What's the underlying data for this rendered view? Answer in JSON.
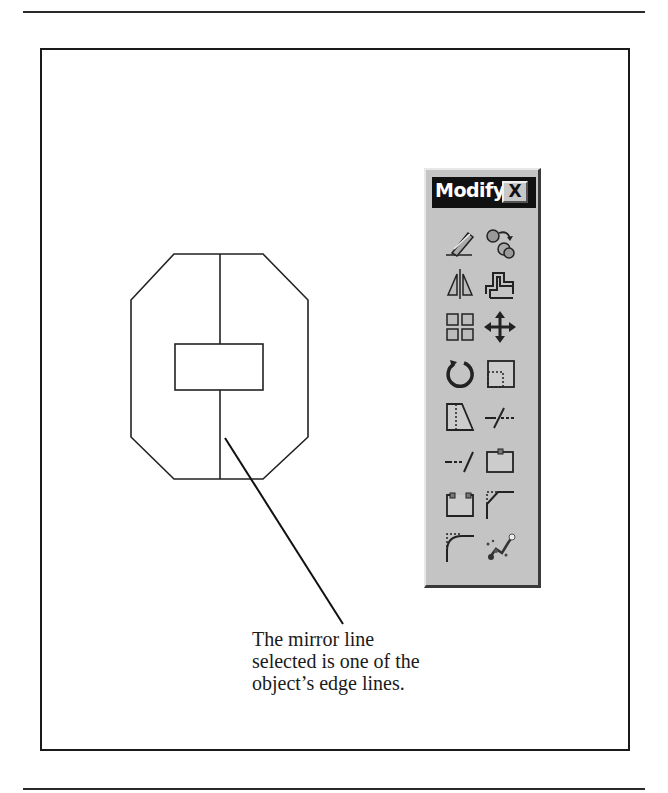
{
  "figure": {
    "toolbar": {
      "title": "Modify",
      "close_label": "X",
      "tools": [
        {
          "name": "erase",
          "icon": "eraser-icon"
        },
        {
          "name": "copy",
          "icon": "copy-object-icon"
        },
        {
          "name": "mirror",
          "icon": "mirror-icon"
        },
        {
          "name": "offset",
          "icon": "offset-icon"
        },
        {
          "name": "array",
          "icon": "array-icon"
        },
        {
          "name": "move",
          "icon": "move-icon"
        },
        {
          "name": "rotate",
          "icon": "rotate-icon"
        },
        {
          "name": "scale",
          "icon": "scale-icon"
        },
        {
          "name": "stretch",
          "icon": "stretch-icon"
        },
        {
          "name": "trim",
          "icon": "trim-icon"
        },
        {
          "name": "extend",
          "icon": "extend-icon"
        },
        {
          "name": "break-at-point",
          "icon": "break-at-point-icon"
        },
        {
          "name": "break",
          "icon": "break-icon"
        },
        {
          "name": "chamfer",
          "icon": "chamfer-icon"
        },
        {
          "name": "fillet",
          "icon": "fillet-icon"
        },
        {
          "name": "explode",
          "icon": "explode-icon"
        }
      ]
    },
    "caption": {
      "lines": [
        "The mirror line",
        "selected is one of the",
        "object’s edge lines."
      ]
    }
  }
}
